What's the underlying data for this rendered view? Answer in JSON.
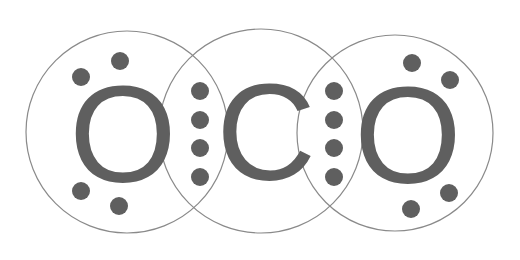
{
  "colors": {
    "background": "#ffffff",
    "shell_stroke": "#8a8a8a",
    "atom_symbol": "#5f5f5f",
    "electron": "#5f5f5f"
  },
  "atoms": [
    {
      "symbol": "O",
      "position": "left",
      "lone_pair_electrons": 4
    },
    {
      "symbol": "C",
      "position": "center",
      "lone_pair_electrons": 0
    },
    {
      "symbol": "O",
      "position": "right",
      "lone_pair_electrons": 4
    }
  ],
  "bonds": [
    {
      "between": [
        "O-left",
        "C"
      ],
      "shared_electrons": 4,
      "type": "double"
    },
    {
      "between": [
        "C",
        "O-right"
      ],
      "shared_electrons": 4,
      "type": "double"
    }
  ]
}
